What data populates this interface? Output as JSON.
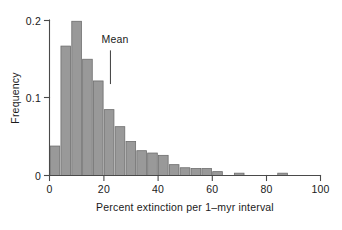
{
  "chart_data": {
    "type": "bar",
    "title": "",
    "subtitle": "",
    "xlabel": "Percent extinction per 1–myr interval",
    "ylabel": "Frequency",
    "xlim": [
      0,
      100
    ],
    "ylim": [
      0,
      0.2
    ],
    "grid": false,
    "legend": null,
    "bin_width": 4,
    "bar_color": "#999999",
    "bar_edge_color": "#6d6d6d",
    "axis_color": "#4a4a4a",
    "xticks": [
      0,
      20,
      40,
      60,
      80,
      100
    ],
    "xtick_labels": [
      "0",
      "20",
      "40",
      "60",
      "80",
      "100"
    ],
    "yticks": [
      0,
      0.1,
      0.2
    ],
    "ytick_labels": [
      "0",
      "0.1",
      "0.2"
    ],
    "bin_starts": [
      0,
      4,
      8,
      12,
      16,
      20,
      24,
      28,
      32,
      36,
      40,
      44,
      48,
      52,
      56,
      60,
      64,
      68,
      72,
      76,
      80,
      84
    ],
    "values": [
      0.038,
      0.167,
      0.199,
      0.15,
      0.122,
      0.085,
      0.063,
      0.044,
      0.032,
      0.029,
      0.026,
      0.014,
      0.01,
      0.009,
      0.009,
      0.005,
      0.0,
      0.003,
      0.0,
      0.0,
      0.0,
      0.003
    ],
    "annotations": [
      {
        "label": "Mean",
        "x": 22.5,
        "y_top": 0.195,
        "y_bottom": 0.118,
        "type": "vertical-marker"
      }
    ]
  },
  "axes": {
    "y_label": "Frequency",
    "x_label": "Percent extinction per 1–myr interval",
    "ytick_0": "0",
    "ytick_1": "0.1",
    "ytick_2": "0.2",
    "xtick_0": "0",
    "xtick_1": "20",
    "xtick_2": "40",
    "xtick_3": "60",
    "xtick_4": "80",
    "xtick_5": "100"
  },
  "annotation": {
    "mean_label": "Mean"
  }
}
